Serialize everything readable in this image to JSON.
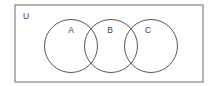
{
  "figure": {
    "type": "venn-diagram",
    "title": "",
    "background_color": "#ffffff"
  },
  "universe": {
    "label": "U",
    "label_x": 26,
    "label_y": 17,
    "rect": {
      "x": 15,
      "y": 5,
      "width": 188,
      "height": 77
    },
    "stroke_color": "#77787b",
    "fill_color": "#ffffff"
  },
  "sets": [
    {
      "label": "A",
      "cx": 71,
      "cy": 46,
      "r": 26.5,
      "label_x": 71,
      "label_y": 31,
      "stroke_color": "#56575a"
    },
    {
      "label": "B",
      "cx": 111,
      "cy": 46,
      "r": 26.5,
      "label_x": 110,
      "label_y": 31,
      "stroke_color": "#56575a"
    },
    {
      "label": "C",
      "cx": 151,
      "cy": 46,
      "r": 26.5,
      "label_x": 148,
      "label_y": 31,
      "stroke_color": "#56575a"
    }
  ],
  "overlaps": [
    {
      "between": [
        "A",
        "B"
      ],
      "described": "lens-shaped intersection"
    },
    {
      "between": [
        "B",
        "C"
      ],
      "described": "lens-shaped intersection"
    }
  ]
}
